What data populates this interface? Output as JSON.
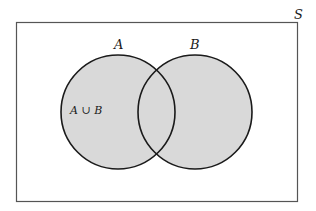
{
  "diagram": {
    "type": "venn",
    "universe_label": "S",
    "sets": [
      {
        "name": "A",
        "label": "A"
      },
      {
        "name": "B",
        "label": "B"
      }
    ],
    "shaded_region_label": "A ∪ B",
    "colors": {
      "fill": "#d9d9d9",
      "stroke": "#1a1a1a",
      "frame": "#555555",
      "background": "#ffffff"
    }
  }
}
